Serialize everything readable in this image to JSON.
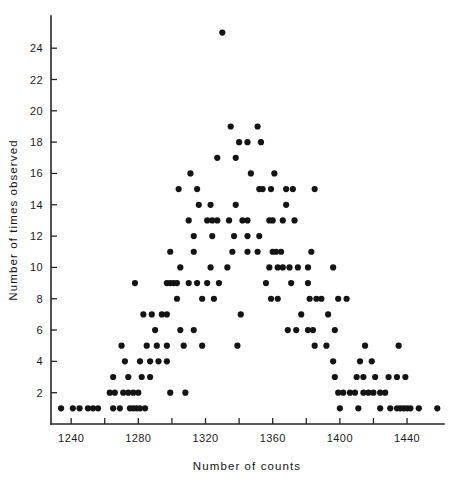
{
  "chart_data": {
    "type": "scatter",
    "title": "",
    "subtitle": "",
    "xlabel": "Number of counts",
    "ylabel": "Number of times observed",
    "xlim": [
      1228,
      1462
    ],
    "ylim": [
      0,
      25.8
    ],
    "grid": false,
    "legend": null,
    "x_ticks": [
      1240,
      1260,
      1280,
      1300,
      1320,
      1340,
      1360,
      1380,
      1400,
      1420,
      1440
    ],
    "x_tick_labels": [
      "1240",
      "",
      "1280",
      "",
      "1320",
      "",
      "1360",
      "",
      "1400",
      "",
      "1440"
    ],
    "x_major_labels": [
      "1240",
      "1280",
      "1320",
      "1360",
      "1400",
      "1440"
    ],
    "y_ticks": [
      2,
      4,
      6,
      8,
      10,
      12,
      14,
      16,
      18,
      20,
      22,
      24
    ],
    "y_tick_labels": [
      "2",
      "4",
      "6",
      "8",
      "10",
      "12",
      "14",
      "16",
      "18",
      "20",
      "22",
      "24"
    ],
    "marker": "filled-circle",
    "marker_color": "#141414",
    "marker_size_px": 3.1,
    "point_count": 232,
    "points": [
      [
        1234,
        1
      ],
      [
        1241,
        1
      ],
      [
        1245,
        1
      ],
      [
        1250,
        1
      ],
      [
        1253,
        1
      ],
      [
        1256,
        1
      ],
      [
        1265,
        1
      ],
      [
        1269,
        1
      ],
      [
        1275,
        1
      ],
      [
        1277,
        1
      ],
      [
        1279,
        1
      ],
      [
        1281,
        1
      ],
      [
        1284,
        1
      ],
      [
        1400,
        1
      ],
      [
        1411,
        1
      ],
      [
        1424,
        1
      ],
      [
        1430,
        1
      ],
      [
        1434,
        1
      ],
      [
        1436,
        1
      ],
      [
        1438,
        1
      ],
      [
        1440,
        1
      ],
      [
        1442,
        1
      ],
      [
        1447,
        1
      ],
      [
        1458,
        1
      ],
      [
        1263,
        2
      ],
      [
        1266,
        2
      ],
      [
        1271,
        2
      ],
      [
        1274,
        2
      ],
      [
        1277,
        2
      ],
      [
        1280,
        2
      ],
      [
        1299,
        2
      ],
      [
        1308,
        2
      ],
      [
        1399,
        2
      ],
      [
        1402,
        2
      ],
      [
        1406,
        2
      ],
      [
        1409,
        2
      ],
      [
        1414,
        2
      ],
      [
        1417,
        2
      ],
      [
        1420,
        2
      ],
      [
        1424,
        2
      ],
      [
        1427,
        2
      ],
      [
        1265,
        3
      ],
      [
        1274,
        3
      ],
      [
        1282,
        3
      ],
      [
        1287,
        3
      ],
      [
        1397,
        3
      ],
      [
        1410,
        3
      ],
      [
        1414,
        3
      ],
      [
        1421,
        3
      ],
      [
        1429,
        3
      ],
      [
        1434,
        3
      ],
      [
        1439,
        3
      ],
      [
        1272,
        4
      ],
      [
        1281,
        4
      ],
      [
        1287,
        4
      ],
      [
        1292,
        4
      ],
      [
        1297,
        4
      ],
      [
        1396,
        4
      ],
      [
        1412,
        4
      ],
      [
        1419,
        4
      ],
      [
        1270,
        5
      ],
      [
        1285,
        5
      ],
      [
        1291,
        5
      ],
      [
        1297,
        5
      ],
      [
        1307,
        5
      ],
      [
        1318,
        5
      ],
      [
        1339,
        5
      ],
      [
        1385,
        5
      ],
      [
        1392,
        5
      ],
      [
        1415,
        5
      ],
      [
        1435,
        5
      ],
      [
        1290,
        6
      ],
      [
        1305,
        6
      ],
      [
        1313,
        6
      ],
      [
        1369,
        6
      ],
      [
        1374,
        6
      ],
      [
        1381,
        6
      ],
      [
        1384,
        6
      ],
      [
        1397,
        6
      ],
      [
        1283,
        7
      ],
      [
        1288,
        7
      ],
      [
        1294,
        7
      ],
      [
        1297,
        7
      ],
      [
        1341,
        7
      ],
      [
        1377,
        7
      ],
      [
        1393,
        7
      ],
      [
        1303,
        8
      ],
      [
        1318,
        8
      ],
      [
        1325,
        8
      ],
      [
        1359,
        8
      ],
      [
        1363,
        8
      ],
      [
        1382,
        8
      ],
      [
        1386,
        8
      ],
      [
        1389,
        8
      ],
      [
        1399,
        8
      ],
      [
        1404,
        8
      ],
      [
        1278,
        9
      ],
      [
        1297,
        9
      ],
      [
        1299,
        9
      ],
      [
        1301,
        9
      ],
      [
        1303,
        9
      ],
      [
        1310,
        9
      ],
      [
        1315,
        9
      ],
      [
        1321,
        9
      ],
      [
        1328,
        9
      ],
      [
        1356,
        9
      ],
      [
        1371,
        9
      ],
      [
        1381,
        9
      ],
      [
        1305,
        10
      ],
      [
        1323,
        10
      ],
      [
        1333,
        10
      ],
      [
        1358,
        10
      ],
      [
        1363,
        10
      ],
      [
        1366,
        10
      ],
      [
        1370,
        10
      ],
      [
        1375,
        10
      ],
      [
        1381,
        10
      ],
      [
        1396,
        10
      ],
      [
        1299,
        11
      ],
      [
        1313,
        11
      ],
      [
        1336,
        11
      ],
      [
        1345,
        11
      ],
      [
        1351,
        11
      ],
      [
        1360,
        11
      ],
      [
        1362,
        11
      ],
      [
        1365,
        11
      ],
      [
        1383,
        11
      ],
      [
        1313,
        12
      ],
      [
        1324,
        12
      ],
      [
        1337,
        12
      ],
      [
        1345,
        12
      ],
      [
        1352,
        12
      ],
      [
        1310,
        13
      ],
      [
        1321,
        13
      ],
      [
        1324,
        13
      ],
      [
        1327,
        13
      ],
      [
        1334,
        13
      ],
      [
        1342,
        13
      ],
      [
        1345,
        13
      ],
      [
        1358,
        13
      ],
      [
        1360,
        13
      ],
      [
        1366,
        13
      ],
      [
        1373,
        13
      ],
      [
        1316,
        14
      ],
      [
        1323,
        14
      ],
      [
        1338,
        14
      ],
      [
        1368,
        14
      ],
      [
        1304,
        15
      ],
      [
        1315,
        15
      ],
      [
        1352,
        15
      ],
      [
        1354,
        15
      ],
      [
        1359,
        15
      ],
      [
        1368,
        15
      ],
      [
        1372,
        15
      ],
      [
        1385,
        15
      ],
      [
        1311,
        16
      ],
      [
        1347,
        16
      ],
      [
        1361,
        16
      ],
      [
        1327,
        17
      ],
      [
        1338,
        17
      ],
      [
        1340,
        18
      ],
      [
        1345,
        18
      ],
      [
        1353,
        18
      ],
      [
        1335,
        19
      ],
      [
        1351,
        19
      ],
      [
        1330,
        25
      ]
    ]
  },
  "axes": {
    "x_axis_name": "x-axis",
    "y_axis_name": "y-axis"
  }
}
